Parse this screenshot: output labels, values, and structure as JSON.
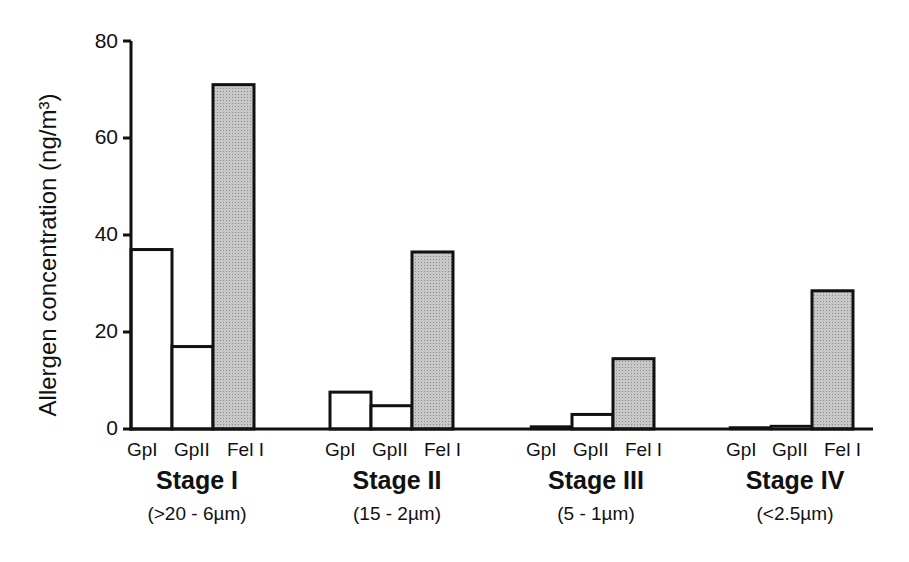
{
  "chart_data": {
    "type": "bar",
    "title": "",
    "xlabel": "",
    "ylabel": "Allergen concentration (ng/m³)",
    "ylim": [
      0,
      80
    ],
    "yticks": [
      0,
      20,
      40,
      60,
      80
    ],
    "grid": false,
    "legend": null,
    "categories": [
      "Stage I",
      "Stage II",
      "Stage III",
      "Stage IV"
    ],
    "category_subtitles": [
      "(>20 - 6µm)",
      "(15 - 2µm)",
      "(5 - 1µm)",
      "(<2.5µm)"
    ],
    "bar_labels": [
      "GpI",
      "GpII",
      "Fel I"
    ],
    "series": [
      {
        "name": "GpI",
        "fill": "#ffffff",
        "values": [
          37,
          7.6,
          0.5,
          0.3
        ]
      },
      {
        "name": "GpII",
        "fill": "#ffffff",
        "values": [
          17,
          4.8,
          3,
          0.6
        ]
      },
      {
        "name": "Fel I",
        "fill": "#c8c8c8",
        "values": [
          71,
          36.5,
          14.5,
          28.5
        ]
      }
    ]
  },
  "labels": {
    "ylabel": "Allergen concentration (ng/m³)",
    "ticks": [
      "0",
      "20",
      "40",
      "60",
      "80"
    ],
    "stages": [
      {
        "name": "Stage I",
        "range": "(>20 - 6µm)",
        "bars": [
          "GpI",
          "GpII",
          "Fel I"
        ]
      },
      {
        "name": "Stage II",
        "range": "(15 - 2µm)",
        "bars": [
          "GpI",
          "GpII",
          "Fel I"
        ]
      },
      {
        "name": "Stage III",
        "range": "(5 - 1µm)",
        "bars": [
          "GpI",
          "GpII",
          "Fel I"
        ]
      },
      {
        "name": "Stage IV",
        "range": "(<2.5µm)",
        "bars": [
          "GpI",
          "GpII",
          "Fel I"
        ]
      }
    ]
  },
  "colors": {
    "axis": "#111111",
    "open_bar": "#ffffff",
    "shaded_bar": "#c8c8c8"
  }
}
